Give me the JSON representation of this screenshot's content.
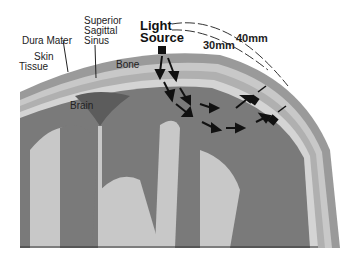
{
  "diagram": {
    "labels": {
      "dura_mater": "Dura Mater",
      "skin": "Skin",
      "tissue": "Tissue",
      "superior": "Superior",
      "sagittal": "Sagittal",
      "sinus": "Sinus",
      "bone": "Bone",
      "brain": "Brain",
      "light": "Light",
      "source": "Source",
      "d40": "40mm",
      "d30": "30mm"
    },
    "colors": {
      "brain_dark": "#7a7a7a",
      "brain_light": "#c8c8c8",
      "skin": "#8a8a8a",
      "bone": "#b4b4b4",
      "sinus": "#5c5c5c",
      "arrow": "#111111"
    }
  }
}
